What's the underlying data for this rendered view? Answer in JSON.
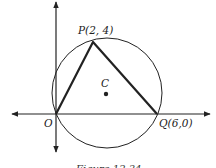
{
  "diagram": {
    "type": "coordinate-geometry",
    "points": {
      "O": {
        "label": "O",
        "coords": "(0,0)"
      },
      "P": {
        "label": "P(2, 4)",
        "coords": "(2,4)"
      },
      "Q": {
        "label": "Q(6,0)",
        "coords": "(6,0)"
      },
      "C": {
        "label": "C"
      }
    },
    "shapes": [
      "circle through O, P, Q",
      "triangle OPQ"
    ],
    "caption": "Figure 12.34"
  },
  "labels": {
    "O": "O",
    "P": "P(2, 4)",
    "Q": "Q(6,0)",
    "C": "C"
  },
  "caption": "Figure 12.34",
  "colors": {
    "stroke": "#222222",
    "background": "#ffffff"
  }
}
